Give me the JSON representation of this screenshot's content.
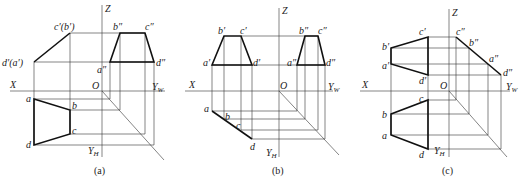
{
  "figures": [
    {
      "id": "a",
      "caption": "(a)",
      "axes": {
        "x": "X",
        "z": "Z",
        "o": "O",
        "yw": "Y",
        "yw_sub": "W",
        "yh": "Y",
        "yh_sub": "H"
      },
      "front_labels": {
        "top": "c′(b′)",
        "bottom": "d′(a′)"
      },
      "side_labels": {
        "b": "b″",
        "c": "c″",
        "a": "a″",
        "d": "d″"
      },
      "plan_labels": {
        "a": "a",
        "b": "b",
        "c": "c",
        "d": "d"
      }
    },
    {
      "id": "b",
      "caption": "(b)",
      "axes": {
        "x": "X",
        "z": "Z",
        "o": "O",
        "yw": "Y",
        "yw_sub": "W",
        "yh": "Y",
        "yh_sub": "H"
      },
      "front_labels": {
        "a": "a′",
        "b": "b′",
        "c": "c′",
        "d": "d′"
      },
      "side_labels": {
        "a": "a″",
        "b": "b″",
        "c": "c″",
        "d": "d″"
      },
      "plan_labels": {
        "a": "a",
        "b": "b",
        "c": "c",
        "d": "d"
      }
    },
    {
      "id": "c",
      "caption": "(c)",
      "axes": {
        "x": "X",
        "z": "Z",
        "o": "O",
        "yw": "Y",
        "yw_sub": "W",
        "yh": "Y",
        "yh_sub": "H"
      },
      "front_labels": {
        "a": "a′",
        "b": "b′",
        "c": "c′",
        "d": "d′"
      },
      "side_labels": {
        "a": "a″",
        "b": "b″",
        "c": "c″",
        "d": "d″"
      },
      "plan_labels": {
        "a": "a",
        "b": "b",
        "c": "c",
        "d": "d"
      }
    }
  ]
}
